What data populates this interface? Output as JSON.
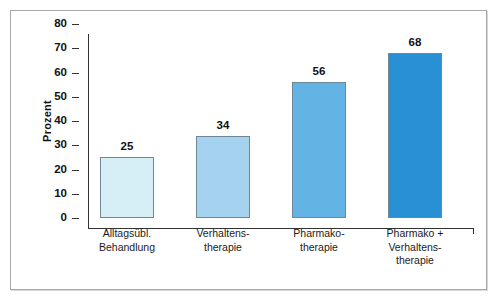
{
  "chart_data": {
    "type": "bar",
    "title": "",
    "subtitle": "",
    "xlabel": "",
    "ylabel": "Prozent",
    "ylim": [
      0,
      80
    ],
    "yticks": [
      0,
      10,
      20,
      30,
      40,
      50,
      60,
      70,
      80
    ],
    "ytick_labels": [
      "0",
      "10",
      "20",
      "30",
      "40",
      "50",
      "60",
      "70",
      "80"
    ],
    "grid": false,
    "legend": false,
    "legend_position": "none",
    "categories": [
      "Alltagsübl.\nBehandlung",
      "Verhaltens-\ntherapie",
      "Pharmako-\ntherapie",
      "Pharmako +\nVerhaltens-\ntherapie"
    ],
    "values": [
      25,
      34,
      56,
      68
    ],
    "data_labels": [
      "25",
      "34",
      "56",
      "68"
    ],
    "bar_colors": [
      "#d6eef5",
      "#a5d3ef",
      "#63b3e4",
      "#2a90d6"
    ],
    "bar_border_color": "#6e8796",
    "axis_color": "#333333",
    "frame_color": "#a8a8a8",
    "background_color": "#ffffff"
  }
}
